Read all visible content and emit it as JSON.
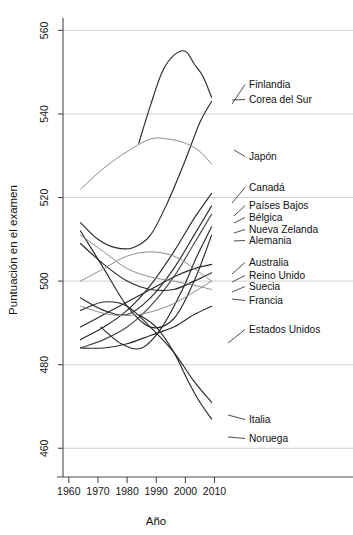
{
  "chart_data": {
    "type": "line",
    "title": "",
    "xlabel": "Año",
    "ylabel": "Puntuación en el examen",
    "xlim": [
      1958,
      2016
    ],
    "ylim": [
      456,
      562
    ],
    "xticks": [
      1960,
      1970,
      1980,
      1990,
      2000,
      2010
    ],
    "xticklabels": [
      "1960",
      "1970",
      "1980",
      "1990",
      "2000",
      "2010"
    ],
    "yticks": [
      460,
      480,
      500,
      520,
      540,
      560
    ],
    "yticklabels": [
      "460",
      "480",
      "500",
      "520",
      "540",
      "560"
    ],
    "grid": "horizontal",
    "legend": "right-side labels with leader lines",
    "series": [
      {
        "name": "Finlandia",
        "color": "#2b2b2b",
        "label_value": "545",
        "x": [
          1984,
          1988,
          1992,
          1996,
          2000,
          2003,
          2006,
          2009
        ],
        "y": [
          533,
          542,
          550,
          554,
          555,
          552,
          549,
          544
        ]
      },
      {
        "name": "Corea del Sur",
        "color": "#2b2b2b",
        "label_value": "542",
        "x": [
          1964,
          1970,
          1976,
          1982,
          1988,
          1994,
          2000,
          2005,
          2009
        ],
        "y": [
          514,
          510,
          508,
          508,
          511,
          519,
          529,
          538,
          543
        ]
      },
      {
        "name": "Japón",
        "color": "#8d8d8d",
        "label_value": "528",
        "x": [
          1964,
          1972,
          1980,
          1988,
          1994,
          2000,
          2005,
          2009
        ],
        "y": [
          522,
          527,
          531,
          534,
          534,
          533,
          531,
          528
        ]
      },
      {
        "name": "Canadá",
        "color": "#2b2b2b",
        "label_value": "521",
        "x": [
          1964,
          1972,
          1980,
          1988,
          1996,
          2003,
          2009
        ],
        "y": [
          486,
          489,
          493,
          499,
          507,
          515,
          521
        ]
      },
      {
        "name": "Países Bajos",
        "color": "#2b2b2b",
        "label_value": "518",
        "x": [
          1964,
          1972,
          1980,
          1988,
          1996,
          2003,
          2009
        ],
        "y": [
          496,
          493,
          492,
          496,
          503,
          511,
          518
        ]
      },
      {
        "name": "Bélgica",
        "color": "#4a4a4a",
        "label_value": "516",
        "x": [
          1964,
          1972,
          1980,
          1988,
          1996,
          2003,
          2009
        ],
        "y": [
          484,
          486,
          489,
          494,
          501,
          509,
          516
        ]
      },
      {
        "name": "Nueva Zelanda",
        "color": "#2b2b2b",
        "label_value": "513",
        "x": [
          1971,
          1978,
          1985,
          1992,
          1999,
          2004,
          2009
        ],
        "y": [
          489,
          485,
          484,
          489,
          498,
          506,
          513
        ]
      },
      {
        "name": "Alemania",
        "color": "#2b2b2b",
        "label_value": "511",
        "x": [
          1964,
          1972,
          1980,
          1988,
          1996,
          2003,
          2009
        ],
        "y": [
          512,
          503,
          494,
          489,
          491,
          500,
          511
        ]
      },
      {
        "name": "Australia",
        "color": "#2b2b2b",
        "label_value": "504",
        "x": [
          1964,
          1972,
          1980,
          1988,
          1996,
          2003,
          2009
        ],
        "y": [
          489,
          492,
          495,
          498,
          501,
          503,
          504
        ]
      },
      {
        "name": "Reino Unido",
        "color": "#2b2b2b",
        "label_value": "502",
        "x": [
          1964,
          1972,
          1980,
          1988,
          1996,
          2003,
          2009
        ],
        "y": [
          509,
          504,
          500,
          498,
          498,
          500,
          502
        ]
      },
      {
        "name": "Suecia",
        "color": "#8d8d8d",
        "label_value": "500",
        "x": [
          1964,
          1972,
          1980,
          1988,
          1996,
          2003,
          2009
        ],
        "y": [
          500,
          503,
          506,
          507,
          506,
          503,
          500
        ]
      },
      {
        "name": "Francia",
        "color": "#8d8d8d",
        "label_value": "498",
        "x": [
          1964,
          1972,
          1980,
          1988,
          1996,
          2003,
          2009
        ],
        "y": [
          511,
          507,
          503,
          501,
          500,
          499,
          498
        ]
      },
      {
        "name": "Estados Unidos",
        "color": "#2b2b2b",
        "label_value": "494",
        "x": [
          1964,
          1972,
          1980,
          1988,
          1996,
          2003,
          2009
        ],
        "y": [
          484,
          484,
          485,
          487,
          489,
          492,
          494
        ]
      },
      {
        "name": "Italia",
        "color": "#2b2b2b",
        "label_value": "471",
        "x": [
          1964,
          1972,
          1980,
          1988,
          1996,
          2003,
          2009
        ],
        "y": [
          493,
          495,
          494,
          489,
          483,
          476,
          471
        ]
      },
      {
        "name": "Noruega",
        "color": "#2b2b2b",
        "label_value": "467",
        "x": [
          1984,
          1990,
          1996,
          2001,
          2005,
          2009
        ],
        "y": [
          492,
          489,
          483,
          476,
          471,
          467
        ]
      },
      {
        "name": "serie-extra-gris",
        "color": "#8d8d8d",
        "label_value": "",
        "x": [
          1964,
          1974,
          1984,
          1994,
          2002,
          2009
        ],
        "y": [
          494,
          492,
          492,
          494,
          497,
          500
        ]
      }
    ],
    "annotations": [
      {
        "label": "Finlandia",
        "y_px": 88,
        "anchor_x_px": 232,
        "anchor_y_px": 104
      },
      {
        "label": "Corea del Sur",
        "y_px": 103,
        "anchor_x_px": 232,
        "anchor_y_px": 100
      },
      {
        "label": "Japón",
        "y_px": 160,
        "anchor_x_px": 234,
        "anchor_y_px": 150
      },
      {
        "label": "Canadá",
        "y_px": 191,
        "anchor_x_px": 232,
        "anchor_y_px": 203
      },
      {
        "label": "Países Bajos",
        "y_px": 209,
        "anchor_x_px": 234,
        "anchor_y_px": 216
      },
      {
        "label": "Bélgica",
        "y_px": 221,
        "anchor_x_px": 234,
        "anchor_y_px": 223
      },
      {
        "label": "Nueva Zelanda",
        "y_px": 233,
        "anchor_x_px": 234,
        "anchor_y_px": 233
      },
      {
        "label": "Alemania",
        "y_px": 244,
        "anchor_x_px": 234,
        "anchor_y_px": 241
      },
      {
        "label": "Australia",
        "y_px": 266,
        "anchor_x_px": 232,
        "anchor_y_px": 274
      },
      {
        "label": "Reino Unido",
        "y_px": 279,
        "anchor_x_px": 232,
        "anchor_y_px": 282
      },
      {
        "label": "Suecia",
        "y_px": 290,
        "anchor_x_px": 232,
        "anchor_y_px": 292
      },
      {
        "label": "Francia",
        "y_px": 304,
        "anchor_x_px": 232,
        "anchor_y_px": 299
      },
      {
        "label": "Estados Unidos",
        "y_px": 333,
        "anchor_x_px": 228,
        "anchor_y_px": 343
      },
      {
        "label": "Italia",
        "y_px": 423,
        "anchor_x_px": 228,
        "anchor_y_px": 415
      },
      {
        "label": "Noruega",
        "y_px": 442,
        "anchor_x_px": 228,
        "anchor_y_px": 437
      }
    ]
  }
}
